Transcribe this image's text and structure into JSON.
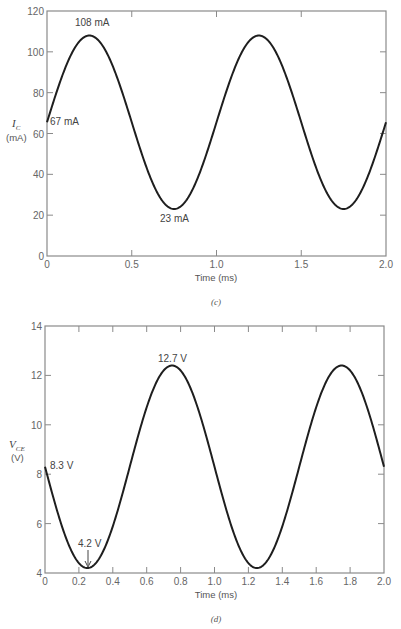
{
  "chart_data": [
    {
      "id": "c",
      "type": "line",
      "caption": "(c)",
      "title": "",
      "xlabel": "Time (ms)",
      "ylabel": "I_C (mA)",
      "ylabel_main": "I",
      "ylabel_sub": "C",
      "ylabel_unit": "(mA)",
      "xlim": [
        0,
        2.0
      ],
      "ylim": [
        0,
        120
      ],
      "xticks": [
        0,
        0.5,
        1.0,
        1.5,
        2.0
      ],
      "xtick_labels": [
        "0",
        "0.5",
        "1.0",
        "1.5",
        "2.0"
      ],
      "yticks": [
        0,
        20,
        40,
        60,
        80,
        100,
        120
      ],
      "ytick_labels": [
        "0",
        "20",
        "40",
        "60",
        "80",
        "100",
        "120"
      ],
      "grid": false,
      "series": [
        {
          "name": "I_C",
          "x": [
            0,
            0.125,
            0.25,
            0.375,
            0.5,
            0.625,
            0.75,
            0.875,
            1.0,
            1.125,
            1.25,
            1.375,
            1.5,
            1.625,
            1.75,
            1.875,
            2.0
          ],
          "y": [
            67,
            96,
            108,
            96,
            67,
            36,
            23,
            36,
            67,
            96,
            108,
            96,
            67,
            36,
            23,
            36,
            67
          ]
        }
      ],
      "annotations": [
        {
          "text": "108 mA",
          "x": 0.25,
          "y": 108
        },
        {
          "text": "67 mA",
          "x": 0,
          "y": 67
        },
        {
          "text": "23 mA",
          "x": 0.75,
          "y": 23
        }
      ]
    },
    {
      "id": "d",
      "type": "line",
      "caption": "(d)",
      "title": "",
      "xlabel": "Time (ms)",
      "ylabel": "V_CE (V)",
      "ylabel_main": "V",
      "ylabel_sub": "CE",
      "ylabel_unit": "(V)",
      "xlim": [
        0,
        2.0
      ],
      "ylim": [
        4,
        14
      ],
      "xticks": [
        0,
        0.2,
        0.4,
        0.6,
        0.8,
        1.0,
        1.2,
        1.4,
        1.6,
        1.8,
        2.0
      ],
      "xtick_labels": [
        "0",
        "0.2",
        "0.4",
        "0.6",
        "0.8",
        "1.0",
        "1.2",
        "1.4",
        "1.6",
        "1.8",
        "2.0"
      ],
      "yticks": [
        4,
        6,
        8,
        10,
        12,
        14
      ],
      "ytick_labels": [
        "4",
        "6",
        "8",
        "10",
        "12",
        "14"
      ],
      "grid": false,
      "series": [
        {
          "name": "V_CE",
          "x": [
            0,
            0.125,
            0.25,
            0.375,
            0.5,
            0.625,
            0.75,
            0.875,
            1.0,
            1.125,
            1.25,
            1.375,
            1.5,
            1.625,
            1.75,
            1.875,
            2.0
          ],
          "y": [
            8.3,
            5.4,
            4.2,
            5.4,
            8.3,
            11.2,
            12.4,
            11.2,
            8.3,
            5.4,
            4.2,
            5.4,
            8.3,
            11.2,
            12.4,
            11.2,
            8.3
          ]
        }
      ],
      "annotations": [
        {
          "text": "12.7 V",
          "x": 0.75,
          "y": 12.4
        },
        {
          "text": "8.3 V",
          "x": 0,
          "y": 8.3
        },
        {
          "text": "4.2 V",
          "x": 0.25,
          "y": 4.2
        }
      ]
    }
  ]
}
